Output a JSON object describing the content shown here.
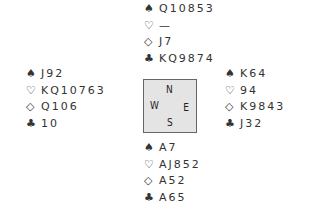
{
  "suit_symbols": {
    "spades": "♠",
    "hearts": "♡",
    "diamonds": "◇",
    "clubs": "♣"
  },
  "compass": {
    "north": "N",
    "south": "S",
    "east": "E",
    "west": "W"
  },
  "hands": {
    "north": {
      "spades": "Q10853",
      "hearts": "—",
      "diamonds": "J7",
      "clubs": "KQ9874"
    },
    "west": {
      "spades": "J92",
      "hearts": "KQ10763",
      "diamonds": "Q106",
      "clubs": "10"
    },
    "east": {
      "spades": "K64",
      "hearts": "94",
      "diamonds": "K9843",
      "clubs": "J32"
    },
    "south": {
      "spades": "A7",
      "hearts": "AJ852",
      "diamonds": "A52",
      "clubs": "A65"
    }
  }
}
